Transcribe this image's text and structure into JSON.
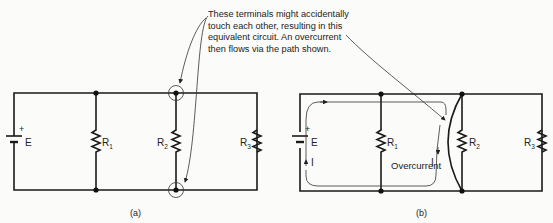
{
  "annotation": {
    "lines": [
      "These terminals might accidentally",
      "touch each other, resulting in this",
      "equivalent circuit. An overcurrent",
      "then flows via the path shown."
    ]
  },
  "circuit_a": {
    "caption": "(a)",
    "battery_label": "E",
    "battery_polarity": "+",
    "resistors": [
      "R",
      "R",
      "R"
    ],
    "resistor_subscripts": [
      "1",
      "2",
      "3"
    ]
  },
  "circuit_b": {
    "caption": "(b)",
    "battery_label": "E",
    "battery_polarity": "+",
    "current_label_left": "I",
    "current_label_right": "I",
    "overcurrent_label": "Overcurrent",
    "resistors": [
      "R",
      "R",
      "R"
    ],
    "resistor_subscripts": [
      "1",
      "2",
      "3"
    ]
  }
}
